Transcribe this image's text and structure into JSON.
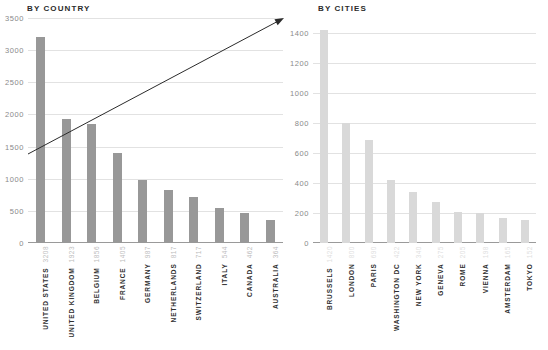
{
  "chart_data": [
    {
      "type": "bar",
      "title": "BY COUNTRY",
      "xlabel": "",
      "ylabel": "",
      "ylim": [
        0,
        3500
      ],
      "yticks": [
        0,
        500,
        1000,
        1500,
        2000,
        2500,
        3000,
        3500
      ],
      "ytick_labels": [
        "0",
        "500",
        "1000",
        "1500",
        "2000",
        "2500",
        "3000",
        "3500"
      ],
      "grid": true,
      "legend": "none",
      "bar_color": "#989898",
      "value_color": "#bdbdbd",
      "categories": [
        "UNITED STATES",
        "UNITED KINGDOM",
        "BELGIUM",
        "FRANCE",
        "GERMANY",
        "NETHERLANDS",
        "SWITZERLAND",
        "ITALY",
        "CANADA",
        "AUSTRALIA"
      ],
      "values": [
        3208,
        1923,
        1856,
        1405,
        987,
        817,
        717,
        544,
        462,
        364
      ],
      "annotations": [
        {
          "type": "arrow",
          "label": "trend-arrow",
          "from": [
            28,
            154
          ],
          "to": [
            284,
            18
          ]
        }
      ]
    },
    {
      "type": "bar",
      "title": "BY CITIES",
      "xlabel": "",
      "ylabel": "",
      "ylim": [
        0,
        1500
      ],
      "yticks": [
        0,
        200,
        400,
        600,
        800,
        1000,
        1200,
        1400
      ],
      "ytick_labels": [
        "0",
        "200",
        "400",
        "600",
        "800",
        "1000",
        "1200",
        "1400"
      ],
      "grid": true,
      "legend": "none",
      "bar_color": "#d9d9d9",
      "value_color": "#e0e0e0",
      "categories": [
        "BRUSSELS",
        "LONDON",
        "PARIS",
        "WASHINGTON DC",
        "NEW YORK",
        "GENEVA",
        "ROME",
        "VIENNA",
        "AMSTERDAM",
        "TOKYO"
      ],
      "values": [
        1420,
        800,
        690,
        422,
        340,
        275,
        205,
        198,
        165,
        152
      ]
    }
  ]
}
